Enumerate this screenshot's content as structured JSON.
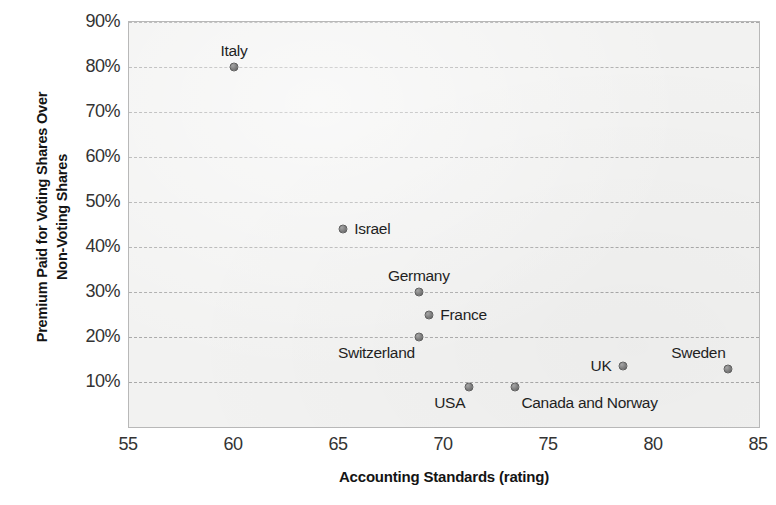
{
  "chart_data": {
    "type": "scatter",
    "title": "",
    "xlabel": "Accounting Standards (rating)",
    "ylabel": "Premium Paid for Voting Shares Over Non-Voting Shares",
    "ylabel_lines": [
      "Premium Paid for Voting Shares Over",
      "Non-Voting Shares"
    ],
    "xlim": [
      55,
      85
    ],
    "ylim": [
      0,
      90
    ],
    "xticks": [
      55,
      60,
      65,
      70,
      75,
      80,
      85
    ],
    "xticklabels": [
      "55",
      "60",
      "65",
      "70",
      "75",
      "80",
      "85"
    ],
    "yticks": [
      10,
      20,
      30,
      40,
      50,
      60,
      70,
      80,
      90
    ],
    "yticklabels": [
      "10%",
      "20%",
      "30%",
      "40%",
      "50%",
      "60%",
      "70%",
      "80%",
      "90%"
    ],
    "grid": "horizontal-dashed",
    "legend": "none",
    "marker_color": "#7d7d7d",
    "plot_background": "#f2f2f1",
    "points": [
      {
        "label": "Italy",
        "x": 60.0,
        "y": 80.0,
        "label_pos": "above"
      },
      {
        "label": "Israel",
        "x": 65.2,
        "y": 44.0,
        "label_pos": "right"
      },
      {
        "label": "Germany",
        "x": 68.8,
        "y": 30.0,
        "label_pos": "above"
      },
      {
        "label": "France",
        "x": 69.3,
        "y": 25.0,
        "label_pos": "right"
      },
      {
        "label": "Switzerland",
        "x": 68.8,
        "y": 20.0,
        "label_pos": "below-left"
      },
      {
        "label": "UK",
        "x": 78.5,
        "y": 13.5,
        "label_pos": "left"
      },
      {
        "label": "Sweden",
        "x": 83.5,
        "y": 13.0,
        "label_pos": "above-left"
      },
      {
        "label": "USA",
        "x": 71.2,
        "y": 9.0,
        "label_pos": "below-left"
      },
      {
        "label": "Canada and Norway",
        "x": 73.4,
        "y": 9.0,
        "label_pos": "below-right"
      }
    ]
  }
}
